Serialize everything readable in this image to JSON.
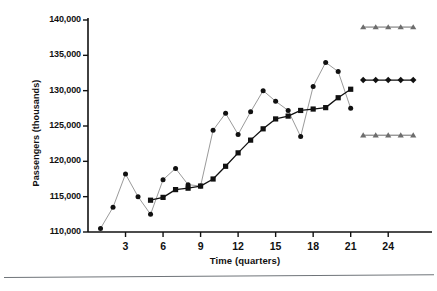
{
  "figure": {
    "kind": "scanned-textbook-figure",
    "background_color": "#ffffff",
    "ink_color": "#111111",
    "rule_color": "#6f7479"
  },
  "chart_data": {
    "type": "line",
    "title": "",
    "subtitle": "",
    "xlabel": "Time (quarters)",
    "ylabel": "Passengers (thousands)",
    "xlim": [
      0,
      27.5
    ],
    "ylim": [
      110000,
      140000
    ],
    "grid": false,
    "legend_position": "none",
    "x_ticks": [
      3,
      6,
      9,
      12,
      15,
      18,
      21,
      24
    ],
    "x_tick_labels": [
      "3",
      "6",
      "9",
      "12",
      "15",
      "18",
      "21",
      "24"
    ],
    "y_ticks": [
      110000,
      115000,
      120000,
      125000,
      130000,
      135000,
      140000
    ],
    "y_tick_labels": [
      "110,000",
      "115,000",
      "120,000",
      "125,000",
      "130,000",
      "135,000",
      "140,000"
    ],
    "series": [
      {
        "name": "Actual passengers",
        "marker": "circle",
        "marker_color": "#111111",
        "line_color": "#9a9a9a",
        "x": [
          1,
          2,
          3,
          4,
          5,
          6,
          7,
          8,
          9,
          10,
          11,
          12,
          13,
          14,
          15,
          16,
          17,
          18,
          19,
          20,
          21
        ],
        "values": [
          110500,
          113500,
          118200,
          115000,
          112500,
          117400,
          119000,
          116700,
          116500,
          124400,
          126800,
          123800,
          127000,
          130000,
          128500,
          127200,
          123500,
          130600,
          134000,
          132700,
          127500
        ]
      },
      {
        "name": "Fitted / smoothed",
        "marker": "square",
        "marker_color": "#111111",
        "line_color": "#111111",
        "x": [
          5,
          6,
          7,
          8,
          9,
          10,
          11,
          12,
          13,
          14,
          15,
          16,
          17,
          18,
          19,
          20,
          21
        ],
        "values": [
          114500,
          114900,
          116000,
          116200,
          116500,
          117500,
          119300,
          121200,
          123000,
          124600,
          126000,
          126400,
          127200,
          127400,
          127600,
          129000,
          130200
        ]
      },
      {
        "name": "Upper forecast limit",
        "marker": "triangle",
        "marker_color": "#6d6d6d",
        "line_color": "#6d6d6d",
        "x": [
          22,
          23,
          24,
          25,
          26
        ],
        "values": [
          139000,
          139000,
          139000,
          139000,
          139000
        ]
      },
      {
        "name": "Point forecast",
        "marker": "diamond",
        "marker_color": "#111111",
        "line_color": "#111111",
        "x": [
          22,
          23,
          24,
          25,
          26
        ],
        "values": [
          131500,
          131500,
          131500,
          131500,
          131500
        ]
      },
      {
        "name": "Lower forecast limit",
        "marker": "triangle",
        "marker_color": "#6d6d6d",
        "line_color": "#6d6d6d",
        "x": [
          22,
          23,
          24,
          25,
          26
        ],
        "values": [
          123700,
          123700,
          123700,
          123700,
          123700
        ]
      }
    ]
  }
}
